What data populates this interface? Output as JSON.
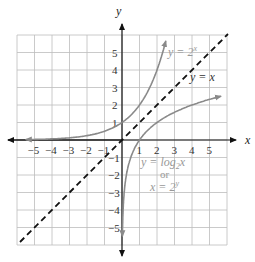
{
  "chart_data": {
    "type": "line",
    "title": "",
    "xlabel": "x",
    "ylabel": "y",
    "xlim": [
      -6,
      6
    ],
    "ylim": [
      -6,
      6
    ],
    "grid": true,
    "x_ticks": [
      "-5",
      "-4",
      "-3",
      "-2",
      "-1",
      "1",
      "2",
      "3",
      "4",
      "5"
    ],
    "y_ticks": [
      "5",
      "4",
      "3",
      "2",
      "1",
      "-1",
      "-2",
      "-3",
      "-4",
      "-5"
    ],
    "series": [
      {
        "name": "y = 2^x",
        "style": "solid",
        "color": "#8a8a8a",
        "x": [
          -5.5,
          -4,
          -3,
          -2,
          -1,
          0,
          1,
          2,
          2.5
        ],
        "y": [
          0.022,
          0.0625,
          0.125,
          0.25,
          0.5,
          1,
          2,
          4,
          5.66
        ]
      },
      {
        "name": "y = x",
        "style": "dashed",
        "color": "#111111",
        "x": [
          -5.5,
          5.5
        ],
        "y": [
          -5.5,
          5.5
        ]
      },
      {
        "name": "y = log2 x",
        "style": "solid",
        "color": "#8a8a8a",
        "x": [
          0.022,
          0.0625,
          0.125,
          0.25,
          0.5,
          1,
          2,
          4,
          5.66
        ],
        "y": [
          -5.5,
          -4,
          -3,
          -2,
          -1,
          0,
          1,
          2,
          2.5
        ]
      }
    ],
    "annotations": [
      {
        "text_main": "y = 2",
        "sup": "x",
        "near": [
          3,
          5.5
        ]
      },
      {
        "text_main": "y = x",
        "near": [
          4.3,
          3.6
        ]
      },
      {
        "text_main": "y = log",
        "sub": "2",
        "tail": "x",
        "near": [
          1.5,
          -1.2
        ]
      },
      {
        "text_main": "or",
        "near": [
          2.5,
          -1.9
        ]
      },
      {
        "text_main": "x = 2",
        "sup": "y",
        "near": [
          2.3,
          -2.6
        ]
      }
    ]
  },
  "labels": {
    "x_axis": "x",
    "y_axis": "y",
    "exp_curve_prefix": "y = 2",
    "exp_curve_sup": "x",
    "identity_line": "y = x",
    "log_curve_prefix": "y = log",
    "log_curve_sub": "2",
    "log_curve_suffix": "x",
    "or_text": "or",
    "inverse_prefix": "x = 2",
    "inverse_sup": "y"
  }
}
